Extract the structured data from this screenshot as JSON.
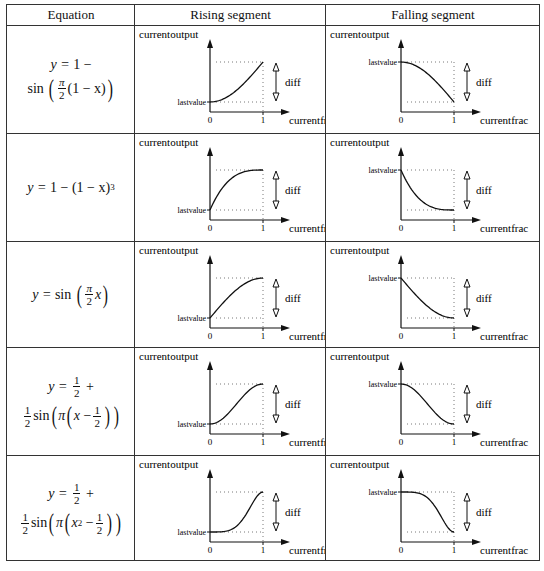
{
  "table": {
    "headers": [
      "Equation",
      "Rising segment",
      "Falling segment"
    ],
    "rows": [
      {
        "equation": {
          "line1": [
            "y = 1 −"
          ],
          "line2_type": "sin_pi2_1mx"
        },
        "equation_text": "y = 1 − sin(π/2 (1 − x))",
        "func": "ease_in_sine"
      },
      {
        "equation_text": "y = 1 − (1 − x)^3",
        "func": "ease_out_cubic"
      },
      {
        "equation_text": "y = sin(π/2 x)",
        "func": "ease_out_sine"
      },
      {
        "equation_text": "y = 1/2 + 1/2 sin(π(x − 1/2))",
        "func": "ease_in_out_sine"
      },
      {
        "equation_text": "y = 1/2 + 1/2 sin(π(x^2 − 1/2))",
        "func": "ease_in_out_sine_sq"
      }
    ]
  },
  "graph_labels": {
    "y_axis": "currentoutput",
    "x_axis": "currentfrac",
    "lastvalue": "lastvalue",
    "diff": "diff",
    "tick0": "0",
    "tick1": "1"
  },
  "eq_text": {
    "y_eq": "y =",
    "one_minus": "1 −",
    "sin": "sin",
    "pi": "π",
    "two": "2",
    "one": "1",
    "x": "x",
    "open": "(",
    "close": ")",
    "minus": "−",
    "plus": "+",
    "one_minus_x": "(1 − x)",
    "cube": "3",
    "sq": "2"
  },
  "chart_data": {
    "type": "line",
    "xlabel": "currentfrac",
    "ylabel": "currentoutput",
    "xlim": [
      0,
      1
    ],
    "series": [
      {
        "name": "y = 1 − sin(π/2 (1 − x))",
        "x": [
          0,
          0.25,
          0.5,
          0.75,
          1
        ],
        "values": [
          0,
          0.076,
          0.293,
          0.617,
          1
        ]
      },
      {
        "name": "y = 1 − (1 − x)^3",
        "x": [
          0,
          0.25,
          0.5,
          0.75,
          1
        ],
        "values": [
          0,
          0.578,
          0.875,
          0.984,
          1
        ]
      },
      {
        "name": "y = sin(π/2 x)",
        "x": [
          0,
          0.25,
          0.5,
          0.75,
          1
        ],
        "values": [
          0,
          0.383,
          0.707,
          0.924,
          1
        ]
      },
      {
        "name": "y = 1/2 + 1/2 sin(π(x − 1/2))",
        "x": [
          0,
          0.25,
          0.5,
          0.75,
          1
        ],
        "values": [
          0,
          0.146,
          0.5,
          0.854,
          1
        ]
      },
      {
        "name": "y = 1/2 + 1/2 sin(π(x^2 − 1/2))",
        "x": [
          0,
          0.25,
          0.5,
          0.75,
          1
        ],
        "values": [
          0,
          0.038,
          0.146,
          0.596,
          1
        ]
      }
    ],
    "annotations": [
      "lastvalue",
      "diff",
      "0",
      "1"
    ]
  }
}
